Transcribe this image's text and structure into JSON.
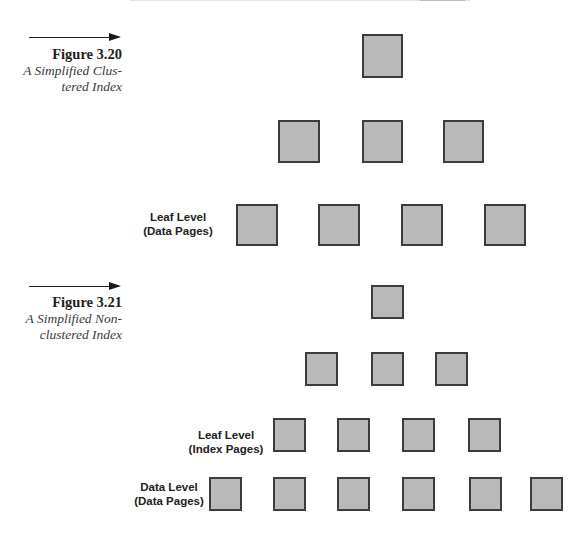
{
  "figures": [
    {
      "number": "Figure 3.20",
      "title_line1": "A Simplified Clus-",
      "title_line2": "tered Index",
      "labels": [
        {
          "line1": "Leaf Level",
          "line2": "(Data Pages)"
        }
      ],
      "levels": [
        {
          "name": "root",
          "page_count": 1
        },
        {
          "name": "intermediate",
          "page_count": 3
        },
        {
          "name": "leaf-data-pages",
          "page_count": 4
        }
      ]
    },
    {
      "number": "Figure 3.21",
      "title_line1": "A Simplified Non-",
      "title_line2": "clustered Index",
      "labels": [
        {
          "line1": "Leaf Level",
          "line2": "(Index Pages)"
        },
        {
          "line1": "Data Level",
          "line2": "(Data Pages)"
        }
      ],
      "levels": [
        {
          "name": "root",
          "page_count": 1
        },
        {
          "name": "intermediate",
          "page_count": 3
        },
        {
          "name": "leaf-index-pages",
          "page_count": 4
        },
        {
          "name": "data-pages",
          "page_count": 6
        }
      ]
    }
  ],
  "colors": {
    "page_fill": "#b9b9b9",
    "page_border": "#3c3c3c"
  }
}
